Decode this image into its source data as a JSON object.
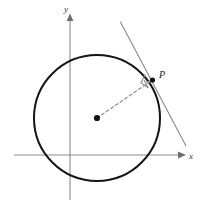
{
  "figure": {
    "kind": "geometry-diagram",
    "width": 206,
    "height": 213,
    "background_color": "#ffffff"
  },
  "axes": {
    "x_label": "x",
    "y_label": "y",
    "origin": {
      "x": 70,
      "y": 155
    },
    "color": "#8c8c8c",
    "stroke_width": 1.1,
    "x_axis": {
      "x1": 14,
      "y1": 155,
      "x2": 182,
      "y2": 155
    },
    "y_axis": {
      "x1": 70,
      "y1": 200,
      "x2": 70,
      "y2": 17
    },
    "x_label_pos": {
      "x": 191,
      "y": 159
    },
    "y_label_pos": {
      "x": 66,
      "y": 13
    },
    "arrowhead_color": "#6e6e6e"
  },
  "circle": {
    "center": {
      "x": 97,
      "y": 118
    },
    "radius": 63,
    "stroke_color": "#151515",
    "stroke_width": 2.0,
    "fill": "none"
  },
  "center_point": {
    "label": "",
    "x": 97,
    "y": 118,
    "radius": 3.1,
    "color": "#111111"
  },
  "tangent_point": {
    "label": "P",
    "x": 152.5,
    "y": 80.0,
    "dot_radius": 2.6,
    "dot_color": "#111111",
    "label_pos": {
      "x": 159,
      "y": 77
    }
  },
  "radius_line": {
    "from": {
      "x": 97,
      "y": 118
    },
    "to": {
      "x": 152.5,
      "y": 80.0
    },
    "style": "dashed",
    "dash_pattern": "3 2.6",
    "color": "#8f8f8f",
    "stroke_width": 1.2
  },
  "tangent_line": {
    "from": {
      "x": 120.5,
      "y": 22.0
    },
    "to": {
      "x": 186.0,
      "y": 146.0
    },
    "style": "solid",
    "color": "#8a8a8a",
    "stroke_width": 1.1
  },
  "right_angle_marker": {
    "present": true,
    "size": 9,
    "color": "#8f8f8f",
    "stroke_width": 1.1,
    "vertex": {
      "x": 152.5,
      "y": 80.0
    }
  },
  "colors": {
    "curve": "#151515",
    "axis": "#8c8c8c",
    "accent": "#8f8f8f",
    "text": "#1a1a1a",
    "background": "#ffffff"
  }
}
